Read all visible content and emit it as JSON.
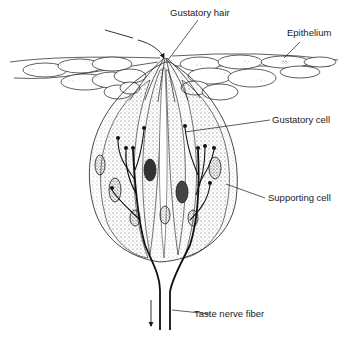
{
  "diagram": {
    "labels": {
      "gustatory_hair": "Gustatory hair",
      "epithelium": "Epithelium",
      "gustatory_cell": "Gustatory cell",
      "supporting_cell": "Supporting cell",
      "taste_nerve_fiber": "Taste nerve fiber"
    },
    "colors": {
      "ink": "#1a1a1a",
      "background": "#ffffff",
      "stipple": "#555555"
    }
  }
}
